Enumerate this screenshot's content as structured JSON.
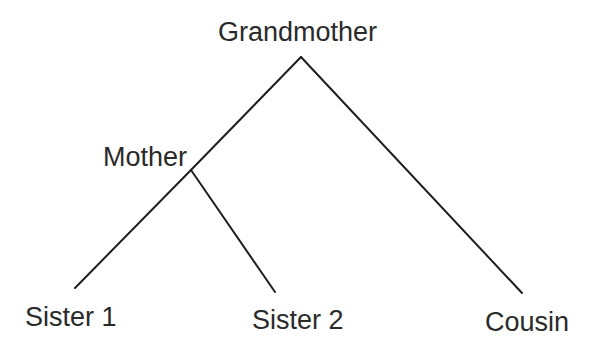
{
  "diagram": {
    "type": "tree",
    "nodes": {
      "grandmother": {
        "label": "Grandmother"
      },
      "mother": {
        "label": "Mother"
      },
      "sister1": {
        "label": "Sister 1"
      },
      "sister2": {
        "label": "Sister 2"
      },
      "cousin": {
        "label": "Cousin"
      }
    },
    "edges": [
      {
        "from": "Grandmother",
        "to": "Mother"
      },
      {
        "from": "Mother",
        "to": "Sister 1"
      },
      {
        "from": "Mother",
        "to": "Sister 2"
      },
      {
        "from": "Grandmother",
        "to": "Cousin"
      }
    ],
    "colors": {
      "line": "#1e1e1e",
      "text": "#2a2a2a",
      "background": "#ffffff"
    }
  }
}
